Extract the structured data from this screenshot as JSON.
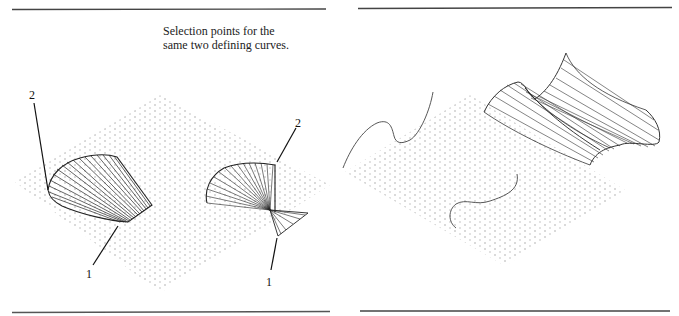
{
  "figure": {
    "caption_lines": [
      "Selection points for the",
      "same two defining curves."
    ],
    "colors": {
      "rule": "#333333",
      "curve": "#333333",
      "grid": "#bbbbbb",
      "text": "#222222"
    }
  },
  "left_panel": {
    "description": "Two ruled surfaces generated from the same two defining curves with different selection points",
    "labels": [
      {
        "id": "label-2-a",
        "text": "2",
        "x": 29,
        "y": 89
      },
      {
        "id": "label-1-a",
        "text": "1",
        "x": 86,
        "y": 268
      },
      {
        "id": "label-2-b",
        "text": "2",
        "x": 295,
        "y": 117
      },
      {
        "id": "label-1-b",
        "text": "1",
        "x": 266,
        "y": 276
      }
    ]
  },
  "right_panel": {
    "description": "Two defining curves and the resulting twisted ruled surface"
  }
}
